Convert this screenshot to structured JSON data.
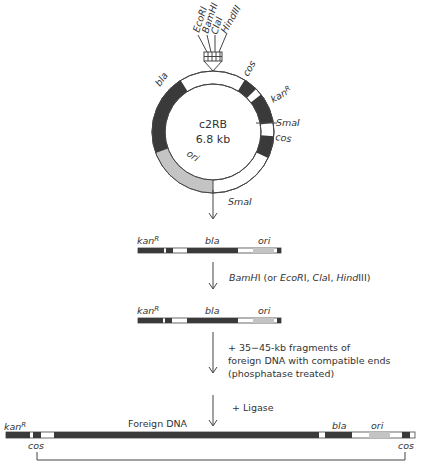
{
  "plasmid": {
    "name": "c2RB",
    "size": "6.8 kb",
    "polylinker_sites": [
      "EcoRI",
      "BamHI",
      "ClaI",
      "HindIII"
    ],
    "labels": {
      "bla": "bla",
      "cos_top": "cos",
      "kan": "kan",
      "kan_sup": "R",
      "smaI": "SmaI",
      "cos_right": "cos",
      "ori": "ori"
    }
  },
  "steps": {
    "step1_enzyme": "SmaI",
    "step2_enzyme": "BamHI (or EcoRI, ClaI, HindIII)",
    "step3_line1": "+ 35−45-kb fragments of",
    "step3_line2": "foreign DNA with compatible ends",
    "step3_line3": "(phosphatase treated)",
    "step4": "+ Ligase"
  },
  "linear1": {
    "kan": "kan",
    "kan_sup": "R",
    "bla": "bla",
    "ori": "ori"
  },
  "linear2": {
    "kan": "kan",
    "kan_sup": "R",
    "bla": "bla",
    "ori": "ori"
  },
  "final": {
    "kan": "kan",
    "kan_sup": "R",
    "cos_left": "cos",
    "foreign": "Foreign DNA",
    "bla": "bla",
    "ori": "ori",
    "cos_right": "cos"
  },
  "colors": {
    "dark": "#3a3a3a",
    "grey": "#c4c4c4",
    "line": "#444444"
  }
}
